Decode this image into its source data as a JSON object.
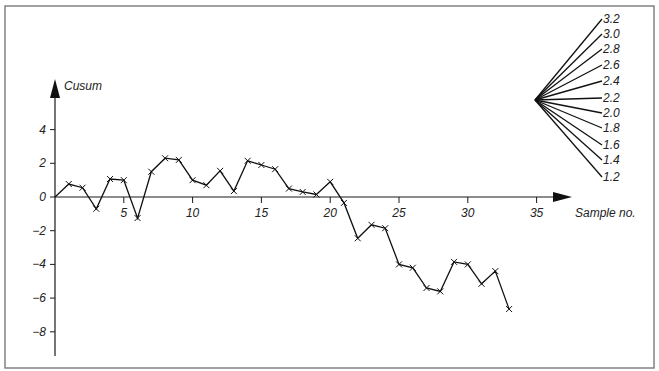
{
  "chart_data": {
    "type": "line",
    "title": "",
    "xlabel": "Sample no.",
    "ylabel": "Cusum",
    "x_ticks": [
      5,
      10,
      15,
      20,
      25,
      30,
      35
    ],
    "x_tick_labels": [
      "5",
      "10",
      "15",
      "20",
      "25",
      "30",
      "35"
    ],
    "y_ticks": [
      4,
      2,
      0,
      -2,
      -4,
      -6,
      -8
    ],
    "y_tick_labels": [
      "4",
      "2",
      "0",
      "−2",
      "−4",
      "−6",
      "−8"
    ],
    "xlim": [
      0,
      36
    ],
    "ylim": [
      -9.5,
      6.5
    ],
    "grid": false,
    "legend": null,
    "marker": "x",
    "series": [
      {
        "name": "Cusum",
        "x": [
          0,
          1,
          2,
          3,
          4,
          5,
          6,
          7,
          8,
          9,
          10,
          11,
          12,
          13,
          14,
          15,
          16,
          17,
          18,
          19,
          20,
          21,
          22,
          23,
          24,
          25,
          26,
          27,
          28,
          29,
          30,
          31,
          32,
          33
        ],
        "values": [
          0,
          0.77,
          0.55,
          -0.7,
          1.07,
          1.0,
          -1.25,
          1.5,
          2.3,
          2.2,
          1.0,
          0.7,
          1.55,
          0.35,
          2.15,
          1.9,
          1.65,
          0.5,
          0.3,
          0.15,
          0.9,
          -0.35,
          -2.45,
          -1.65,
          -1.85,
          -4.0,
          -4.2,
          -5.4,
          -5.6,
          -3.85,
          -4.0,
          -5.15,
          -4.4,
          -6.65
        ]
      }
    ],
    "v_mask": {
      "description": "Fan of reference lines (V-mask slopes) emanating from a common origin",
      "labels": [
        "3.2",
        "3.0",
        "2.8",
        "2.6",
        "2.4",
        "2.2",
        "2.0",
        "1.8",
        "1.6",
        "1.4",
        "1.2"
      ]
    }
  }
}
